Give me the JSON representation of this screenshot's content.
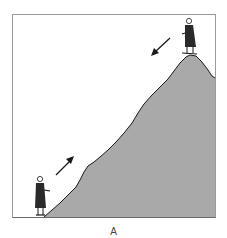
{
  "figure": {
    "caption": "A",
    "colors": {
      "frame": "#9a9a9a",
      "mountain_fill": "#a9a9a9",
      "outline": "#1a1a1a",
      "figure_coat": "#2a2a2a",
      "background": "#ffffff"
    },
    "elements": {
      "person_bottom": "person at base facing right",
      "person_top": "person at summit",
      "arrow_up": "arrow pointing up the slope",
      "arrow_down": "arrow pointing down the slope"
    }
  }
}
